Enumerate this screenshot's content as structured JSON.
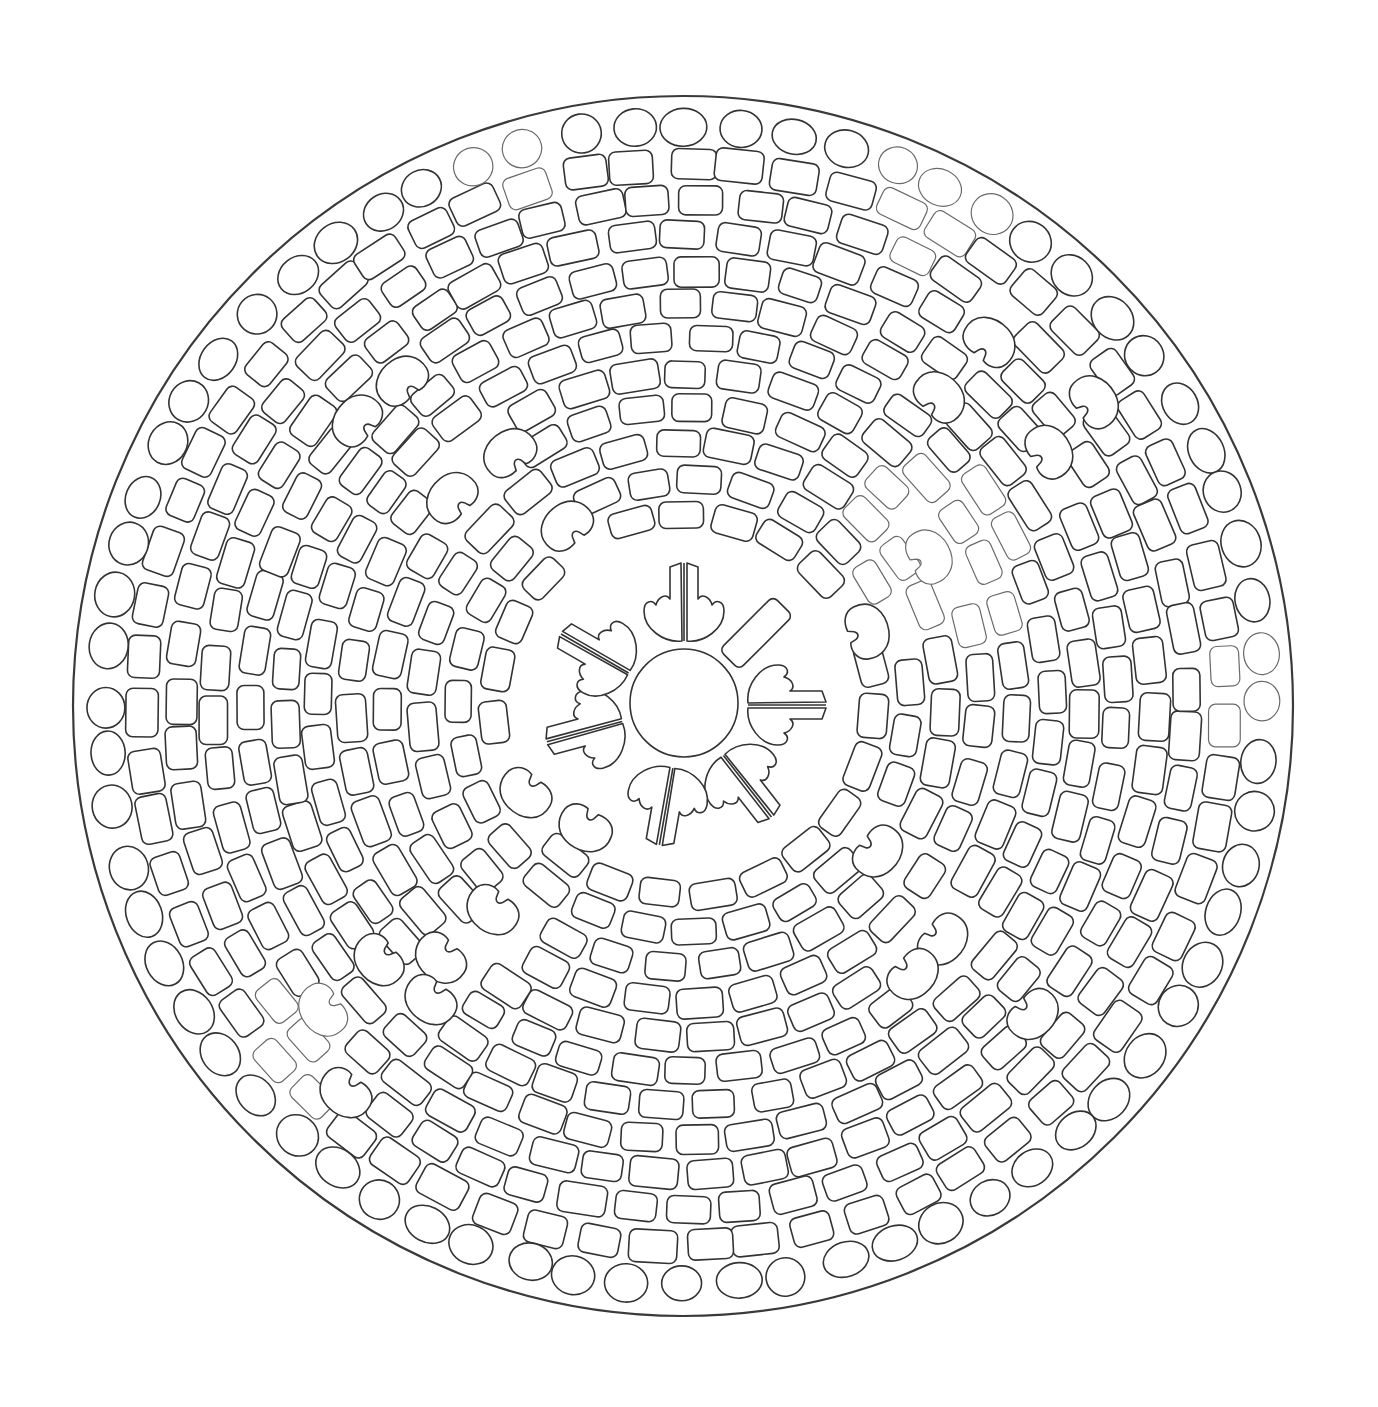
{
  "canvas": {
    "width": 1378,
    "height": 1407,
    "background": "#ffffff"
  },
  "colors": {
    "line": "#333333",
    "outer_line": "#3a3a3a",
    "light_line": "#6a6a6a",
    "fill": "#ffffff"
  },
  "mandala": {
    "title": "",
    "center": {
      "x": 684,
      "y": 705
    },
    "outer_circle": {
      "cx": 683,
      "cy": 706,
      "r": 610
    },
    "center_circle": {
      "cx": 684,
      "cy": 703,
      "r": 54
    },
    "rings": [
      {
        "r": 190,
        "count": 23,
        "w": 44,
        "h": 28,
        "shape": "brick",
        "offset": 0.2
      },
      {
        "r": 225,
        "count": 27,
        "w": 44,
        "h": 28,
        "shape": "brick",
        "offset": 0.55
      },
      {
        "r": 262,
        "count": 31,
        "w": 45,
        "h": 29,
        "shape": "brick",
        "offset": 0.1
      },
      {
        "r": 297,
        "count": 35,
        "w": 45,
        "h": 29,
        "shape": "brick",
        "offset": 0.45
      },
      {
        "r": 332,
        "count": 39,
        "w": 45,
        "h": 29,
        "shape": "brick",
        "offset": 0.3
      },
      {
        "r": 367,
        "count": 43,
        "w": 45,
        "h": 28,
        "shape": "brick",
        "offset": 0.7
      },
      {
        "r": 400,
        "count": 47,
        "w": 45,
        "h": 29,
        "shape": "brick",
        "offset": 0.15
      },
      {
        "r": 434,
        "count": 51,
        "w": 45,
        "h": 29,
        "shape": "brick",
        "offset": 0.5
      },
      {
        "r": 469,
        "count": 55,
        "w": 46,
        "h": 30,
        "shape": "brick",
        "offset": 0.25
      },
      {
        "r": 504,
        "count": 59,
        "w": 46,
        "h": 30,
        "shape": "brick",
        "offset": 0.65
      },
      {
        "r": 541,
        "count": 63,
        "w": 45,
        "h": 32,
        "shape": "brick",
        "offset": 0.35
      },
      {
        "r": 579,
        "count": 68,
        "w": 44,
        "h": 38,
        "shape": "pebble",
        "offset": 0.0
      }
    ],
    "petals": [
      {
        "angle": -90,
        "type": "split-petal"
      },
      {
        "angle": -45,
        "type": "bar"
      },
      {
        "angle": 0,
        "type": "split-petal"
      },
      {
        "angle": 52,
        "type": "split-petal"
      },
      {
        "angle": 100,
        "type": "split-petal"
      },
      {
        "angle": 165,
        "type": "split-petal"
      },
      {
        "angle": -150,
        "type": "split-petal"
      }
    ],
    "petal_geometry": {
      "inner_r": 62,
      "outer_r": 142,
      "half_width": 44
    },
    "kidney_tiles": [
      {
        "x": 400,
        "y": 380,
        "rot": -40
      },
      {
        "x": 355,
        "y": 420,
        "rot": -50
      },
      {
        "x": 450,
        "y": 497,
        "rot": -45
      },
      {
        "x": 508,
        "y": 452,
        "rot": -35
      },
      {
        "x": 565,
        "y": 525,
        "rot": -40
      },
      {
        "x": 990,
        "y": 340,
        "rot": 40
      },
      {
        "x": 1050,
        "y": 450,
        "rot": 60
      },
      {
        "x": 1095,
        "y": 400,
        "rot": 55
      },
      {
        "x": 940,
        "y": 395,
        "rot": 45
      },
      {
        "x": 930,
        "y": 555,
        "rot": 65
      },
      {
        "x": 868,
        "y": 630,
        "rot": 75
      },
      {
        "x": 880,
        "y": 852,
        "rot": 130
      },
      {
        "x": 945,
        "y": 940,
        "rot": 130
      },
      {
        "x": 915,
        "y": 975,
        "rot": 135
      },
      {
        "x": 1035,
        "y": 1015,
        "rot": 135
      },
      {
        "x": 525,
        "y": 795,
        "rot": -140
      },
      {
        "x": 585,
        "y": 830,
        "rot": -150
      },
      {
        "x": 492,
        "y": 912,
        "rot": -140
      },
      {
        "x": 440,
        "y": 960,
        "rot": -135
      },
      {
        "x": 378,
        "y": 962,
        "rot": -130
      },
      {
        "x": 430,
        "y": 1002,
        "rot": -140
      },
      {
        "x": 345,
        "y": 1095,
        "rot": -140
      },
      {
        "x": 322,
        "y": 1012,
        "rot": -125
      }
    ],
    "light_tile_regions": [
      {
        "x": 930,
        "y": 200,
        "r": 70
      },
      {
        "x": 940,
        "y": 560,
        "r": 90
      },
      {
        "x": 300,
        "y": 1040,
        "r": 60
      },
      {
        "x": 1250,
        "y": 680,
        "r": 60
      },
      {
        "x": 520,
        "y": 140,
        "r": 60
      }
    ]
  }
}
